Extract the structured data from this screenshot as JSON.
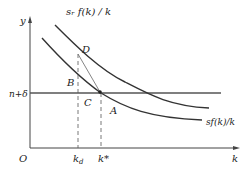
{
  "diagram": {
    "type": "economics-growth-diagram",
    "axes": {
      "y_label": "y",
      "x_label": "k",
      "origin_label": "O"
    },
    "curves": [
      {
        "name": "upper-curve",
        "label": "s_r f(k) / k",
        "label_display": "sᵣ f(k) / k"
      },
      {
        "name": "lower-curve",
        "label": "sf(k)/k",
        "label_display": "sf(k)/k"
      }
    ],
    "horizontal_line": {
      "label": "n+δ"
    },
    "points": {
      "D": "D",
      "B": "B",
      "C": "C",
      "A": "A"
    },
    "x_ticks": {
      "kd": "k",
      "kd_sub": "d",
      "kstar": "k*"
    }
  }
}
